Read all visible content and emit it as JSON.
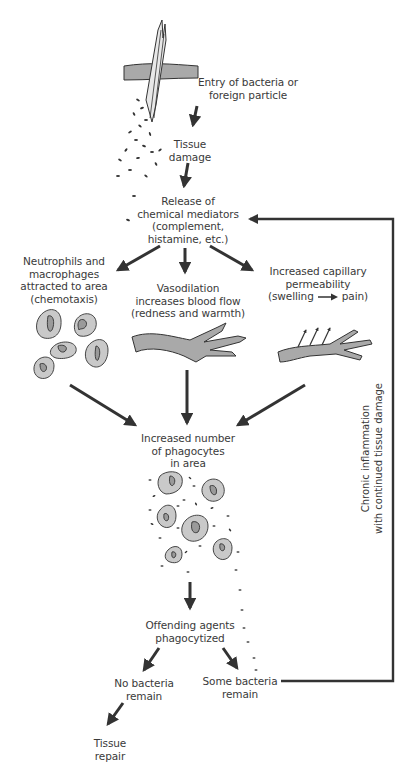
{
  "diagram": {
    "type": "flowchart",
    "topic": "Inflammatory response",
    "colors": {
      "ink": "#333333",
      "tissue_fill": "#a9a9a9",
      "cell_fill": "#c9c9c9",
      "background": "#ffffff"
    },
    "nodes": {
      "entry": {
        "lines": [
          "Entry of bacteria or",
          "foreign particle"
        ]
      },
      "tissue_damage": {
        "lines": [
          "Tissue",
          "damage"
        ]
      },
      "mediators": {
        "lines": [
          "Release of",
          "chemical mediators",
          "(complement,",
          "histamine, etc.)"
        ]
      },
      "chemotaxis": {
        "lines": [
          "Neutrophils and",
          "macrophages",
          "attracted to area",
          "(chemotaxis)"
        ]
      },
      "vasodilation": {
        "lines": [
          "Vasodilation",
          "increases blood flow",
          "(redness and warmth)"
        ]
      },
      "permeability": {
        "lines": [
          "Increased capillary",
          "permeability"
        ],
        "effect_from": "(swelling",
        "effect_to": "pain)"
      },
      "phagocytes": {
        "lines": [
          "Increased number",
          "of phagocytes",
          "in area"
        ]
      },
      "phagocytized": {
        "lines": [
          "Offending agents",
          "phagocytized"
        ]
      },
      "no_bacteria": {
        "lines": [
          "No bacteria",
          "remain"
        ]
      },
      "some_bacteria": {
        "lines": [
          "Some bacteria",
          "remain"
        ]
      },
      "tissue_repair": {
        "lines": [
          "Tissue",
          "repair"
        ]
      }
    },
    "feedback_loop": {
      "lines": [
        "Chronic inflammation",
        "with continued tissue damage"
      ]
    },
    "icons": [
      "splinter-in-skin-icon",
      "bacteria-scatter-icon",
      "phagocyte-cells-icon",
      "dilated-vessel-icon",
      "leaky-capillary-icon",
      "phagocytosis-cluster-icon"
    ],
    "edges": [
      [
        "entry",
        "tissue_damage"
      ],
      [
        "tissue_damage",
        "mediators"
      ],
      [
        "mediators",
        "chemotaxis"
      ],
      [
        "mediators",
        "vasodilation"
      ],
      [
        "mediators",
        "permeability"
      ],
      [
        "chemotaxis",
        "phagocytes"
      ],
      [
        "vasodilation",
        "phagocytes"
      ],
      [
        "permeability",
        "phagocytes"
      ],
      [
        "phagocytes",
        "phagocytized"
      ],
      [
        "phagocytized",
        "no_bacteria"
      ],
      [
        "phagocytized",
        "some_bacteria"
      ],
      [
        "no_bacteria",
        "tissue_repair"
      ],
      [
        "some_bacteria",
        "mediators"
      ]
    ]
  }
}
